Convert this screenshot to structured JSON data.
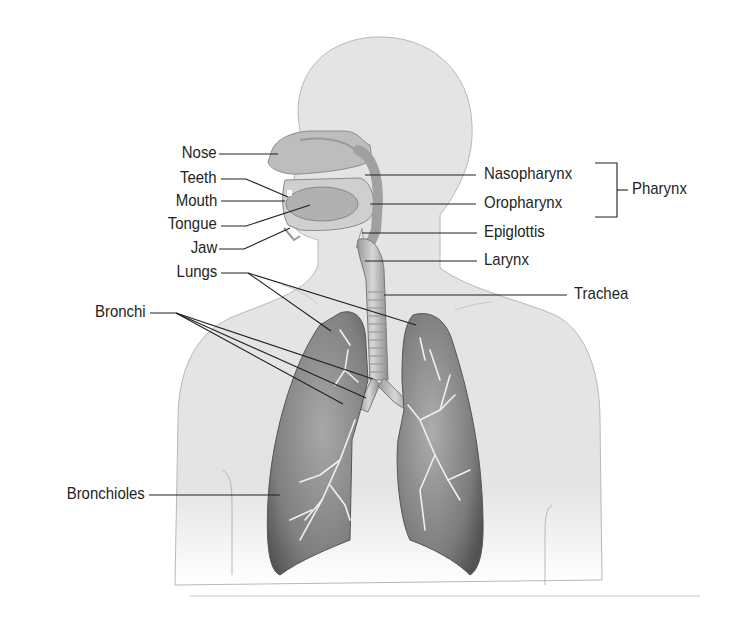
{
  "figure": {
    "colors": {
      "background": "#ffffff",
      "body_fill": "#e6e6e6",
      "body_outline": "#b5b5b5",
      "organ_fill": "#bdbdbd",
      "lung_fill": "#8c8c8c",
      "lung_dark": "#5e5e5e",
      "bronchiole_lines": "#eeeeee",
      "leader_lines": "#231f20",
      "label_text": "#231f20"
    }
  },
  "labels": {
    "left": [
      {
        "id": "nose",
        "text": "Nose"
      },
      {
        "id": "teeth",
        "text": "Teeth"
      },
      {
        "id": "mouth",
        "text": "Mouth"
      },
      {
        "id": "tongue",
        "text": "Tongue"
      },
      {
        "id": "jaw",
        "text": "Jaw"
      },
      {
        "id": "lungs",
        "text": "Lungs"
      },
      {
        "id": "bronchi",
        "text": "Bronchi"
      },
      {
        "id": "bronchioles",
        "text": "Bronchioles"
      }
    ],
    "right": [
      {
        "id": "nasopharynx",
        "text": "Nasopharynx"
      },
      {
        "id": "oropharynx",
        "text": "Oropharynx"
      },
      {
        "id": "epiglottis",
        "text": "Epiglottis"
      },
      {
        "id": "larynx",
        "text": "Larynx"
      },
      {
        "id": "trachea",
        "text": "Trachea"
      }
    ],
    "group": {
      "id": "pharynx",
      "text": "Pharynx",
      "members": [
        "Nasopharynx",
        "Oropharynx"
      ]
    }
  }
}
